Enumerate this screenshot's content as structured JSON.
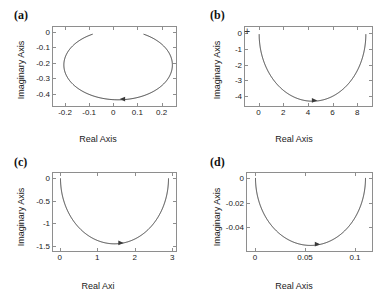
{
  "figure": {
    "background": "#ffffff",
    "curve_color": "#3a3a3a",
    "axis_color": "#8e8e8e",
    "text_color": "#222222"
  },
  "chart_data": [
    {
      "type": "line",
      "panel": "a",
      "label": "(a)",
      "title": "",
      "xlabel": "Real Axis",
      "ylabel": "Imaginary Axis",
      "xlim": [
        -0.25,
        0.26
      ],
      "ylim": [
        -0.48,
        0.03
      ],
      "xticks": [
        -0.2,
        -0.1,
        0,
        0.1,
        0.2
      ],
      "xticklabels": [
        "-0.2",
        "-0.1",
        "0",
        "0.1",
        "0.2"
      ],
      "yticks": [
        0,
        -0.1,
        -0.2,
        -0.3,
        -0.4
      ],
      "yticklabels": [
        "0",
        "-0.1",
        "-0.2",
        "-0.3",
        "-0.4"
      ],
      "grid": false,
      "shape": "open-ellipse",
      "ellipse": {
        "cx": 0.02,
        "cy": -0.215,
        "rx": 0.225,
        "ry": 0.225
      },
      "gap_degrees": [
        62,
        118
      ],
      "arrow_at": {
        "x": 0.04,
        "y": -0.435
      },
      "plus_marker": null
    },
    {
      "type": "line",
      "panel": "b",
      "label": "(b)",
      "title": "",
      "xlabel": "Real Axis",
      "ylabel": "Imaginary Axis",
      "xlim": [
        -1.1,
        9.2
      ],
      "ylim": [
        -4.6,
        0.35
      ],
      "xticks": [
        0,
        2,
        4,
        6,
        8
      ],
      "xticklabels": [
        "0",
        "2",
        "4",
        "6",
        "8"
      ],
      "yticks": [
        0,
        -1,
        -2,
        -3,
        -4
      ],
      "yticklabels": [
        "0",
        "-1",
        "-2",
        "-3",
        "-4"
      ],
      "grid": false,
      "shape": "u-curve",
      "curve": {
        "x_start": 0.05,
        "x_end": 8.7,
        "y_min": -4.3,
        "y_top": -0.1
      },
      "arrow_at": {
        "x": 4.5,
        "y": -4.25
      },
      "plus_marker": {
        "x": -0.85,
        "y": 0.0
      }
    },
    {
      "type": "line",
      "panel": "c",
      "label": "(c)",
      "title": "",
      "xlabel": "Real Axi",
      "ylabel": "Imaginary Axis",
      "xlim": [
        -0.18,
        3.1
      ],
      "ylim": [
        -1.62,
        0.12
      ],
      "xticks": [
        0,
        1,
        2,
        3
      ],
      "xticklabels": [
        "0",
        "1",
        "2",
        "3"
      ],
      "yticks": [
        0,
        -0.5,
        -1,
        -1.5
      ],
      "yticklabels": [
        "0",
        "-0.5",
        "-1",
        "-1.5"
      ],
      "grid": false,
      "shape": "u-curve",
      "curve": {
        "x_start": 0.02,
        "x_end": 2.9,
        "y_min": -1.46,
        "y_top": 0.0
      },
      "arrow_at": {
        "x": 1.62,
        "y": -1.44
      },
      "plus_marker": null
    },
    {
      "type": "line",
      "panel": "d",
      "label": "(d)",
      "title": "",
      "xlabel": "Real Axis",
      "ylabel": "Imaginary Axis",
      "xlim": [
        -0.008,
        0.117
      ],
      "ylim": [
        -0.059,
        0.004
      ],
      "xticks": [
        0,
        0.05,
        0.1
      ],
      "xticklabels": [
        "0",
        "0.05",
        "0.1"
      ],
      "yticks": [
        0,
        -0.02,
        -0.04
      ],
      "yticklabels": [
        "0",
        "-0.02",
        "-0.04"
      ],
      "grid": false,
      "shape": "u-curve",
      "curve": {
        "x_start": 0.0005,
        "x_end": 0.1105,
        "y_min": -0.0545,
        "y_top": 0.0
      },
      "arrow_at": {
        "x": 0.062,
        "y": -0.0535
      },
      "plus_marker": null
    }
  ]
}
